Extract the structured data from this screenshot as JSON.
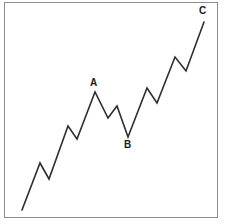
{
  "figure": {
    "background_color": "#ffffff",
    "border_color": "#8c8c8c",
    "line_color": "#2e2e2e"
  },
  "labels": {
    "a": "A",
    "b": "B",
    "c": "C"
  },
  "chart_data": {
    "type": "line",
    "title": "",
    "xlabel": "",
    "ylabel": "",
    "grid": false,
    "legend": "none",
    "axes_visible": false,
    "xlim": [
      0,
      226
    ],
    "ylim": [
      224,
      0
    ],
    "annotations": [
      {
        "text": "A",
        "x": 95,
        "y": 92,
        "position": "above"
      },
      {
        "text": "B",
        "x": 128,
        "y": 137,
        "position": "below"
      },
      {
        "text": "C",
        "x": 204,
        "y": 22,
        "position": "above"
      }
    ],
    "series": [
      {
        "name": "zigzag-wave",
        "points": [
          [
            22,
            210
          ],
          [
            40,
            163
          ],
          [
            49,
            179
          ],
          [
            68,
            126
          ],
          [
            77,
            139
          ],
          [
            95,
            92
          ],
          [
            108,
            118
          ],
          [
            117,
            106
          ],
          [
            128,
            137
          ],
          [
            147,
            88
          ],
          [
            157,
            103
          ],
          [
            175,
            57
          ],
          [
            186,
            71
          ],
          [
            204,
            22
          ]
        ]
      }
    ],
    "path_d": "M22,210 L40,163 L49,179 L68,126 L77,139 L95,92 L108,118 L117,106 L128,137 L147,88 L157,103 L175,57 L186,71 L204,22"
  }
}
